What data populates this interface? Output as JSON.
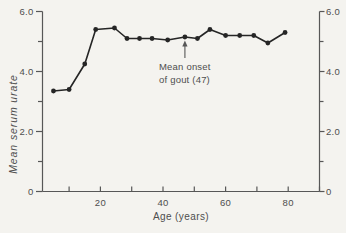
{
  "figure": {
    "background": "#f4f3ef",
    "ink": "#252525",
    "axis_color": "#575757",
    "text_color": "#4e4e4e"
  },
  "chart_data": {
    "type": "line",
    "title": "",
    "xlabel": "Age (years)",
    "ylabel": "Mean serum urate",
    "x": [
      5,
      10,
      15,
      18.5,
      24.5,
      28.5,
      32.5,
      36.5,
      41.5,
      47,
      51,
      55,
      60,
      64.5,
      69,
      73.5,
      79
    ],
    "values": [
      3.35,
      3.4,
      4.25,
      5.4,
      5.45,
      5.1,
      5.1,
      5.1,
      5.05,
      5.15,
      5.1,
      5.4,
      5.2,
      5.2,
      5.2,
      4.95,
      5.3
    ],
    "xlim": [
      1.5,
      90
    ],
    "ylim": [
      0,
      6
    ],
    "grid": false,
    "legend": null,
    "marker": "filled-circle",
    "axes": [
      "left",
      "right",
      "bottom"
    ],
    "right_axis_mirrors_left": true,
    "x_major_ticks": [
      {
        "v": 20,
        "label": "20"
      },
      {
        "v": 40,
        "label": "40"
      },
      {
        "v": 60,
        "label": "60"
      },
      {
        "v": 80,
        "label": "80"
      }
    ],
    "x_minor_ticks": [
      10,
      30,
      50,
      70,
      90
    ],
    "y_major_ticks": [
      {
        "v": 6,
        "label": "6.0"
      },
      {
        "v": 4,
        "label": "4.0"
      },
      {
        "v": 2,
        "label": "2.0"
      },
      {
        "v": 0,
        "label": "0"
      }
    ],
    "y_minor_ticks": [
      5,
      3,
      1
    ],
    "annotation": {
      "line1": "Mean onset",
      "line2": "of gout (47)",
      "full_text": "Mean onset of gout (47)",
      "arrow_points_to_x": 47
    }
  }
}
